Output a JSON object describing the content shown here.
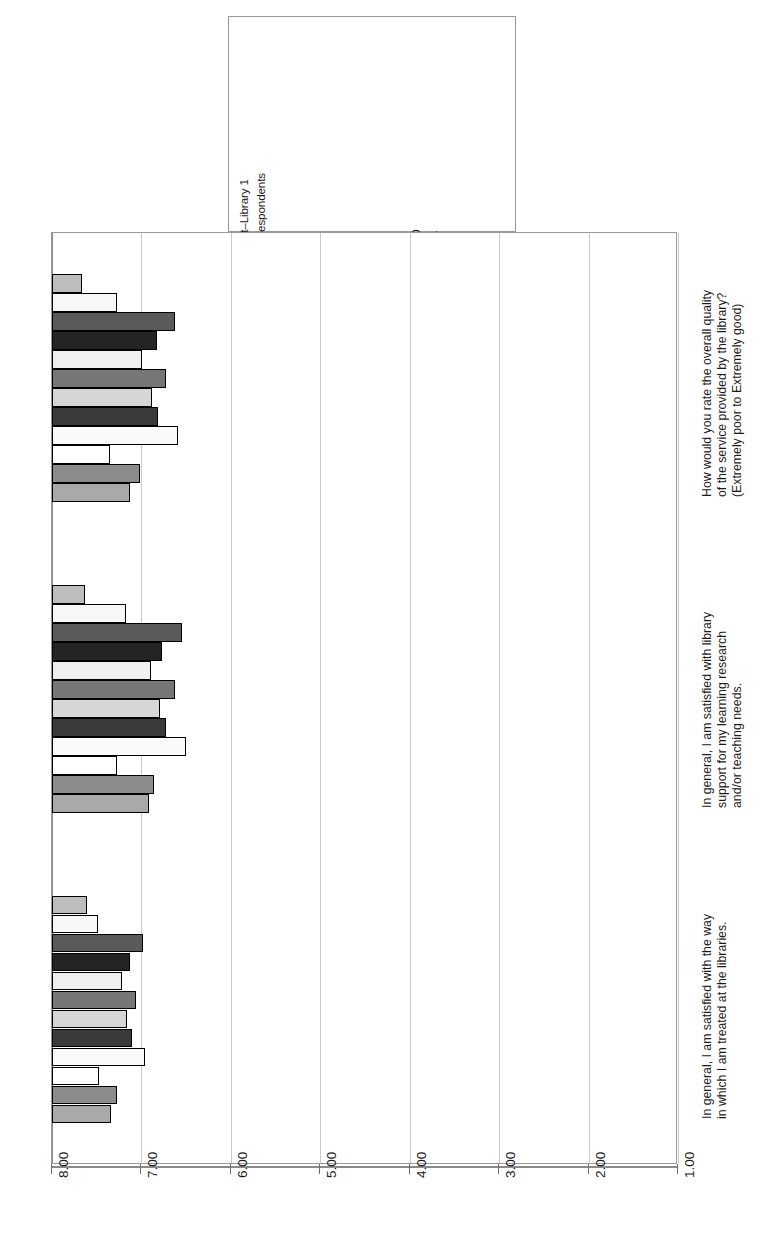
{
  "chart_data": {
    "type": "bar",
    "orientation": "horizontal-rotated",
    "title": "",
    "xlabel": "",
    "ylabel": "",
    "xlim": [
      1.0,
      8.0
    ],
    "grid": true,
    "legend_position": "top-right",
    "tick_labels": [
      "8.00",
      "7.00",
      "6.00",
      "5.00",
      "4.00",
      "3.00",
      "2.00",
      "1.00"
    ],
    "tick_values": [
      8.0,
      7.0,
      6.0,
      5.0,
      4.0,
      3.0,
      2.0,
      1.0
    ],
    "axis_reversed": true,
    "categories": [
      "In general, I am satisfied with the way in which I am treated at the libraries.",
      "In general, I am satisfied with library support for my learning research and/or teaching needs.",
      "How would you rate the overall quality of the service provided by the library? (Extremely poor to Extremely good)"
    ],
    "category_lines": [
      [
        "In general, I am satisfied with the way",
        "in which I am treated at the libraries."
      ],
      [
        "In general, I am satisfied with library",
        "support for my learning research",
        "and/or teaching needs."
      ],
      [
        "How would you rate the overall quality",
        "of the service provided by the library?",
        "(Extremely poor to Extremely good)"
      ]
    ],
    "series": [
      {
        "name": "Vanderbilt–Library 1",
        "color": "#a9a9a9",
        "values": [
          7.34,
          6.92,
          7.13
        ]
      },
      {
        "name": "ARL–All respondents",
        "color": "#8c8c8c",
        "values": [
          7.27,
          6.86,
          7.02
        ]
      },
      {
        "name": "Library 2",
        "color": "#ffffff",
        "values": [
          7.47,
          7.27,
          7.35
        ]
      },
      {
        "name": "Library 3",
        "color": "#fafafa",
        "values": [
          6.96,
          6.5,
          6.59
        ]
      },
      {
        "name": "Library 4",
        "color": "#3a3a3a",
        "values": [
          7.1,
          6.72,
          6.82
        ]
      },
      {
        "name": "Library 5",
        "color": "#d6d6d6",
        "values": [
          7.16,
          6.79,
          6.88
        ]
      },
      {
        "name": "Library 6",
        "color": "#767676",
        "values": [
          7.06,
          6.63,
          6.72
        ]
      },
      {
        "name": "Library 7",
        "color": "#efefef",
        "values": [
          7.22,
          6.89,
          6.99
        ]
      },
      {
        "name": "Library 8",
        "color": "#242424",
        "values": [
          7.13,
          6.77,
          6.83
        ]
      },
      {
        "name": "Library 9",
        "color": "#5a5a5a",
        "values": [
          6.98,
          6.55,
          6.62
        ]
      },
      {
        "name": "Library 10",
        "color": "#f7f7f7",
        "values": [
          7.49,
          7.17,
          7.27
        ]
      },
      {
        "name": "Library 11",
        "color": "#bdbdbd",
        "values": [
          7.61,
          7.63,
          7.66
        ]
      }
    ]
  },
  "legend": {
    "entries": [
      {
        "label": "Vanderbilt–Library 1"
      },
      {
        "label": "ARL–All respondents"
      },
      {
        "label": "Library 2"
      },
      {
        "label": "Library 3"
      },
      {
        "label": "Library 4"
      },
      {
        "label": "Library 5"
      },
      {
        "label": "Library 6"
      },
      {
        "label": "Library 7"
      },
      {
        "label": "Library 8"
      },
      {
        "label": "Library 9"
      },
      {
        "label": "Library 10"
      },
      {
        "label": "Library 11"
      }
    ]
  }
}
